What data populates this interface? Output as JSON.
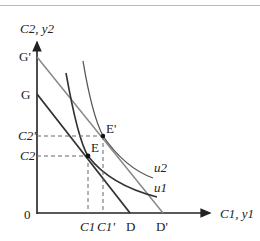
{
  "diagram": {
    "y_axis_label": "C2, y2",
    "x_axis_label": "C1, y1",
    "origin_label": "0",
    "points": {
      "G_prime": "G'",
      "G": "G",
      "D": "D",
      "D_prime": "D'",
      "E": "E",
      "E_prime": "E'"
    },
    "y_ticks": [
      "C2'",
      "C2"
    ],
    "x_ticks": [
      "C1",
      "C1'"
    ],
    "curves": [
      "u1",
      "u2"
    ],
    "colors": {
      "axis": "#222222",
      "inner_budget": "#333333",
      "outer_budget": "#888888",
      "indifference": "#333333"
    }
  }
}
